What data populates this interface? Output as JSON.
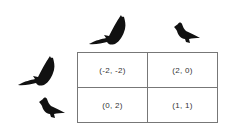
{
  "column_players": [
    {
      "strategy": "hawk",
      "icon": "hawk-icon"
    },
    {
      "strategy": "dove",
      "icon": "dove-icon"
    }
  ],
  "row_players": [
    {
      "strategy": "hawk",
      "icon": "hawk-icon"
    },
    {
      "strategy": "dove",
      "icon": "dove-icon"
    }
  ],
  "payoffs": [
    [
      "(-2, -2)",
      "(2, 0)"
    ],
    [
      "(0, 2)",
      "(1, 1)"
    ]
  ],
  "colors": {
    "silhouette": "#111111",
    "grid": "#777777",
    "text": "#333333"
  }
}
